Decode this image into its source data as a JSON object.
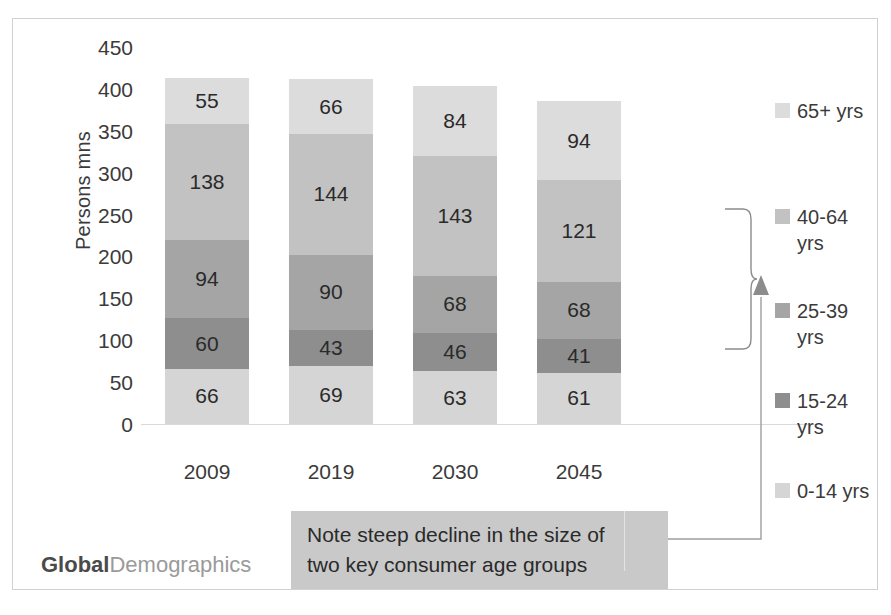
{
  "top_sliver_text": "",
  "chart_data": {
    "type": "bar",
    "subtype": "stacked-vertical",
    "title": "",
    "xlabel": "",
    "ylabel": "Persons mns",
    "ylim": [
      0,
      450
    ],
    "yticks": [
      450,
      400,
      350,
      300,
      250,
      200,
      150,
      100,
      50,
      0
    ],
    "grid": false,
    "legend_position": "right",
    "categories": [
      "2009",
      "2019",
      "2030",
      "2045"
    ],
    "series": [
      {
        "name": "0-14 yrs",
        "values": [
          66,
          69,
          63,
          61
        ],
        "color": "#d5d5d5"
      },
      {
        "name": "15-24 yrs",
        "values": [
          60,
          43,
          46,
          41
        ],
        "color": "#8e8e8e"
      },
      {
        "name": "25-39 yrs",
        "values": [
          94,
          90,
          68,
          68
        ],
        "color": "#a5a5a5"
      },
      {
        "name": "40-64 yrs",
        "values": [
          138,
          144,
          143,
          121
        ],
        "color": "#c2c2c2"
      },
      {
        "name": "65+ yrs",
        "values": [
          55,
          66,
          84,
          94
        ],
        "color": "#dcdcdc"
      }
    ],
    "totals": [
      413,
      412,
      404,
      385
    ]
  },
  "legend": {
    "items": [
      {
        "label": "65+ yrs",
        "color": "#dcdcdc"
      },
      {
        "label": "40-64 yrs",
        "color": "#c2c2c2"
      },
      {
        "label": "25-39 yrs",
        "color": "#a5a5a5"
      },
      {
        "label": "15-24 yrs",
        "color": "#8e8e8e"
      },
      {
        "label": "0-14 yrs",
        "color": "#d5d5d5"
      }
    ]
  },
  "annotation": {
    "note_line_1": "Note steep decline in the size of",
    "note_line_2": "two key consumer age groups",
    "note_bg": "#c9c9c9"
  },
  "logo": {
    "part1": "Global",
    "part2": "Demographics"
  }
}
